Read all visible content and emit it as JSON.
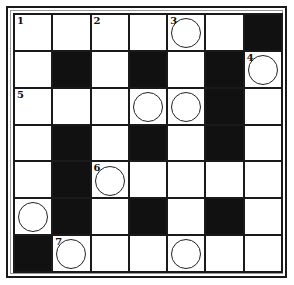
{
  "puzzle": {
    "type": "crossword",
    "rows": 7,
    "cols": 7,
    "colors": {
      "black": "#111111",
      "white": "#ffffff",
      "line": "#1a1a1a"
    },
    "grid": [
      [
        {
          "b": 0,
          "n": "1"
        },
        {
          "b": 0
        },
        {
          "b": 0,
          "n": "2"
        },
        {
          "b": 0
        },
        {
          "b": 0,
          "n": "3",
          "c": 1
        },
        {
          "b": 0
        },
        {
          "b": 1
        }
      ],
      [
        {
          "b": 0
        },
        {
          "b": 1
        },
        {
          "b": 0
        },
        {
          "b": 1
        },
        {
          "b": 0
        },
        {
          "b": 1
        },
        {
          "b": 0,
          "n": "4",
          "c": 1
        }
      ],
      [
        {
          "b": 0,
          "n": "5"
        },
        {
          "b": 0
        },
        {
          "b": 0
        },
        {
          "b": 0,
          "c": 1
        },
        {
          "b": 0,
          "c": 1
        },
        {
          "b": 1
        },
        {
          "b": 0
        }
      ],
      [
        {
          "b": 0
        },
        {
          "b": 1
        },
        {
          "b": 0
        },
        {
          "b": 1
        },
        {
          "b": 0
        },
        {
          "b": 1
        },
        {
          "b": 0
        }
      ],
      [
        {
          "b": 0
        },
        {
          "b": 1
        },
        {
          "b": 0,
          "n": "6",
          "c": 1
        },
        {
          "b": 0
        },
        {
          "b": 0
        },
        {
          "b": 0
        },
        {
          "b": 0
        }
      ],
      [
        {
          "b": 0,
          "c": 1
        },
        {
          "b": 1
        },
        {
          "b": 0
        },
        {
          "b": 1
        },
        {
          "b": 0
        },
        {
          "b": 1
        },
        {
          "b": 0
        }
      ],
      [
        {
          "b": 1
        },
        {
          "b": 0,
          "n": "7",
          "c": 1
        },
        {
          "b": 0
        },
        {
          "b": 0
        },
        {
          "b": 0,
          "c": 1
        },
        {
          "b": 0
        },
        {
          "b": 0
        }
      ]
    ]
  }
}
